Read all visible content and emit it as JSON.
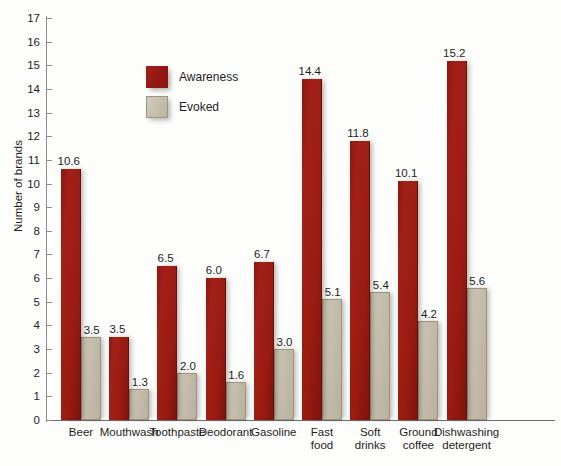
{
  "chart_data": {
    "type": "bar",
    "title": "",
    "subtitle": "",
    "xlabel": "",
    "ylabel": "Number of brands",
    "ylim": [
      0,
      17
    ],
    "ytick_step": 1,
    "yticks": [
      "0",
      "1",
      "2",
      "3",
      "4",
      "5",
      "6",
      "7",
      "8",
      "9",
      "10",
      "11",
      "12",
      "13",
      "14",
      "15",
      "16",
      "17"
    ],
    "grid": false,
    "legend_position": "upper-left-inside",
    "categories": [
      "Beer",
      "Mouthwash",
      "Toothpaste",
      "Deodorant",
      "Gasoline",
      "Fast\nfood",
      "Soft\ndrinks",
      "Ground\ncoffee",
      "Dishwashing\ndetergent"
    ],
    "series": [
      {
        "name": "Awareness",
        "color": "#9a1b12",
        "values": [
          10.6,
          3.5,
          6.5,
          6.0,
          6.7,
          14.4,
          11.8,
          10.1,
          15.2
        ],
        "labels": [
          "10.6",
          "3.5",
          "6.5",
          "6.0",
          "6.7",
          "14.4",
          "11.8",
          "10.1",
          "15.2"
        ]
      },
      {
        "name": "Evoked",
        "color": "#c6beac",
        "values": [
          3.5,
          1.3,
          2.0,
          1.6,
          3.0,
          5.1,
          5.4,
          4.2,
          5.6
        ],
        "labels": [
          "3.5",
          "1.3",
          "2.0",
          "1.6",
          "3.0",
          "5.1",
          "5.4",
          "4.2",
          "5.6"
        ]
      }
    ]
  },
  "legend": {
    "items": [
      {
        "label": "Awareness",
        "swatch": "awareness"
      },
      {
        "label": "Evoked",
        "swatch": "evoked"
      }
    ]
  }
}
